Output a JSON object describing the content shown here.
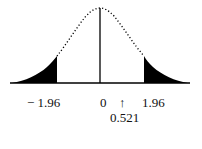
{
  "figure": {
    "type": "normal-distribution-two-tailed-test",
    "curve_style": "dotted",
    "rejection_region_fill": "#000000",
    "labels": {
      "left_critical": "− 1.96",
      "center": "0",
      "arrow": "↑",
      "right_critical": "1.96",
      "test_statistic": "0.521"
    },
    "values": {
      "left_critical": -1.96,
      "mean": 0,
      "right_critical": 1.96,
      "test_statistic": 0.521
    }
  }
}
